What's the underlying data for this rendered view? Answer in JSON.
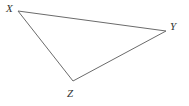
{
  "figure": {
    "type": "geometry-diagram",
    "shape": "triangle",
    "name": "Triangle XYZ",
    "background_color": "#ffffff",
    "stroke_color": "#6b6b6b",
    "stroke_width": 1,
    "label_color": "#333333",
    "canvas": {
      "width": 189,
      "height": 106
    },
    "vertices": [
      {
        "id": "X",
        "label": "X",
        "x": 18,
        "y": 11,
        "label_x": 6,
        "label_y": 3
      },
      {
        "id": "Y",
        "label": "Y",
        "x": 166,
        "y": 31,
        "label_x": 170,
        "label_y": 21
      },
      {
        "id": "Z",
        "label": "Z",
        "x": 73,
        "y": 81,
        "label_x": 67,
        "label_y": 88
      }
    ],
    "edges": [
      {
        "id": "XY",
        "from": "X",
        "to": "Y"
      },
      {
        "id": "YZ",
        "from": "Y",
        "to": "Z"
      },
      {
        "id": "ZX",
        "from": "Z",
        "to": "X"
      }
    ],
    "polygon_points": "18,11 166,31 73,81"
  }
}
